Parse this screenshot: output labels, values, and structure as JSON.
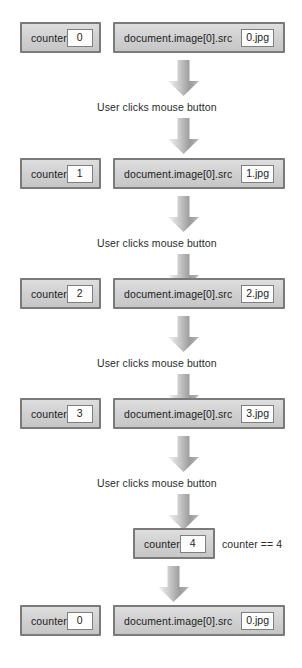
{
  "diagram": {
    "colors": {
      "box_fill_top": "#dedede",
      "box_fill_bottom": "#c6c6c6",
      "box_border": "#7a7a7a",
      "value_fill": "#fdfdfd",
      "value_border": "#7f7f7f",
      "arrow_light": "#efefef",
      "arrow_dark": "#8e8e8e",
      "text": "#1d1d1d"
    },
    "labels": {
      "counter_name": "counter",
      "document_name": "document.image[0].src",
      "click_caption": "User clicks mouse button",
      "condition_note": "counter == 4"
    },
    "steps": [
      {
        "id": "step-0",
        "counter_value": "0",
        "src_value": "0.jpg",
        "caption": "User clicks mouse button"
      },
      {
        "id": "step-1",
        "counter_value": "1",
        "src_value": "1.jpg",
        "caption": "User clicks mouse button"
      },
      {
        "id": "step-2",
        "counter_value": "2",
        "src_value": "2.jpg",
        "caption": "User clicks mouse button"
      },
      {
        "id": "step-3",
        "counter_value": "3",
        "src_value": "3.jpg",
        "caption": "User clicks mouse button"
      }
    ],
    "reset": {
      "id": "step-reset",
      "counter_overflow_value": "4",
      "condition_note": "counter == 4",
      "counter_value": "0",
      "src_value": "0.jpg"
    }
  }
}
